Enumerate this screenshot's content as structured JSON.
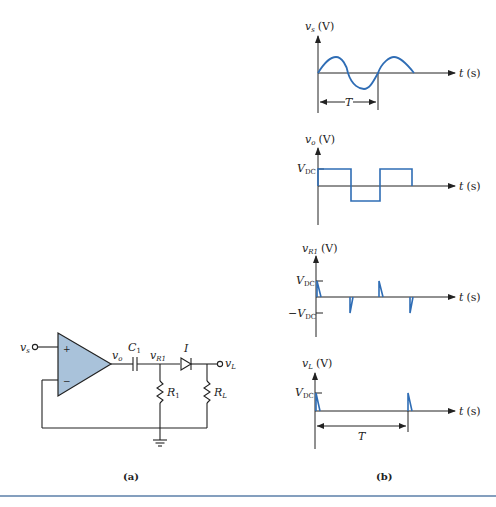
{
  "figure": {
    "panel_a_label": "(a)",
    "panel_b_label": "(b)",
    "colors": {
      "wave": "#2f6db5",
      "opamp_fill": "#a9c2da",
      "ink": "#222222",
      "rule": "#5b7fa8"
    }
  },
  "circuit": {
    "input_label": "v",
    "input_sub": "s",
    "plus": "+",
    "minus": "−",
    "output_label": "v",
    "output_sub": "o",
    "capacitor_label": "C",
    "capacitor_sub": "1",
    "node_label": "v",
    "node_sub": "R1",
    "diode_label": "I",
    "load_label": "v",
    "load_sub": "L",
    "r1_label": "R",
    "r1_sub": "1",
    "rl_label": "R",
    "rl_sub": "L"
  },
  "plots": [
    {
      "ylabel": "v",
      "ysub": "s",
      "yunit": "(V)",
      "xlabel": "t",
      "xunit": "(s)",
      "period_label": "T"
    },
    {
      "ylabel": "v",
      "ysub": "o",
      "yunit": "(V)",
      "xlabel": "t",
      "xunit": "(s)",
      "level_label": "V",
      "level_sub": "DC"
    },
    {
      "ylabel": "v",
      "ysub": "R1",
      "yunit": "(V)",
      "xlabel": "t",
      "xunit": "(s)",
      "pos_label": "V",
      "pos_sub": "DC",
      "neg_label": "−V",
      "neg_sub": "DC"
    },
    {
      "ylabel": "v",
      "ysub": "L",
      "yunit": "(V)",
      "xlabel": "t",
      "xunit": "(s)",
      "level_label": "V",
      "level_sub": "DC",
      "period_label": "T"
    }
  ]
}
